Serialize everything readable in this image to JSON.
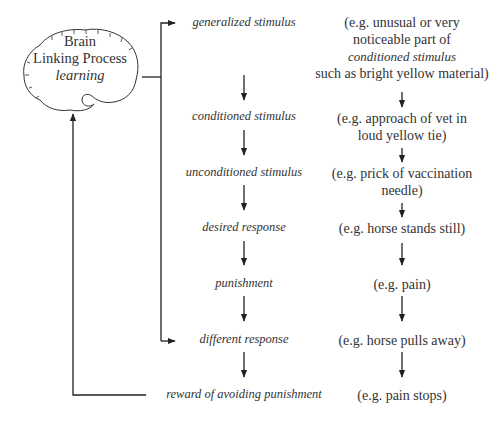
{
  "brain": {
    "line1": "Brain",
    "line2": "Linking Process",
    "line3": "learning"
  },
  "steps": [
    {
      "label": "generalized stimulus"
    },
    {
      "label": "conditioned stimulus"
    },
    {
      "label": "unconditioned stimulus"
    },
    {
      "label": "desired response"
    },
    {
      "label": "punishment"
    },
    {
      "label": "different response"
    },
    {
      "label": "reward of avoiding punishment"
    }
  ],
  "examples": [
    {
      "line1": "(e.g. unusual or very",
      "line2": "noticeable part of",
      "line3": "conditioned stimulus",
      "line4": "such as bright yellow material)"
    },
    {
      "line1": "(e.g. approach of vet in",
      "line2": "loud yellow tie)"
    },
    {
      "line1": "(e.g. prick of vaccination",
      "line2": "needle)"
    },
    {
      "line1": "(e.g. horse stands still)"
    },
    {
      "line1": "(e.g. pain)"
    },
    {
      "line1": "(e.g. horse pulls away)"
    },
    {
      "line1": "(e.g.  pain stops)"
    }
  ],
  "colors": {
    "line": "#222222",
    "text": "#333333",
    "background": "#ffffff"
  }
}
